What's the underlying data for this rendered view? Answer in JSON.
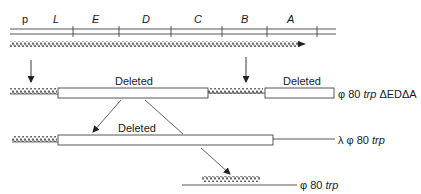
{
  "gene_map": {
    "labels": [
      "p",
      "L",
      "E",
      "D",
      "C",
      "B",
      "A"
    ]
  },
  "rows": {
    "deleted_label": "Deleted",
    "strain_1": {
      "prefix": "φ 80 ",
      "italic": "trp",
      "suffix": " ΔEDΔA"
    },
    "strain_2": {
      "prefix": "λ φ 80 ",
      "italic": "trp",
      "suffix": ""
    },
    "strain_3": {
      "prefix": "φ 80 ",
      "italic": "trp",
      "suffix": ""
    }
  },
  "colors": {
    "ink": "#333333",
    "background": "#ffffff"
  }
}
